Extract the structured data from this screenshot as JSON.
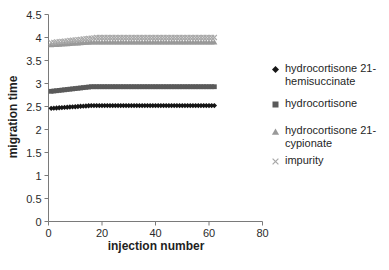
{
  "figure": {
    "background": "#ffffff",
    "axis_color": "#7a7a7a",
    "tick_text_color": "#2b2b2b"
  },
  "chart_data": {
    "type": "scatter",
    "title": "",
    "xlabel": "injection number",
    "ylabel": "migration time",
    "xlim": [
      0,
      80
    ],
    "ylim": [
      0,
      4.5
    ],
    "x_ticks": [
      "0",
      "20",
      "40",
      "60",
      "80"
    ],
    "y_ticks": [
      "0",
      "0.5",
      "1",
      "1.5",
      "2",
      "2.5",
      "3",
      "3.5",
      "4",
      "4.5"
    ],
    "grid": "off",
    "legend_position": "right",
    "x": [
      1,
      2,
      3,
      4,
      5,
      6,
      7,
      8,
      9,
      10,
      11,
      12,
      13,
      14,
      15,
      16,
      17,
      18,
      19,
      20,
      21,
      22,
      23,
      24,
      25,
      26,
      27,
      28,
      29,
      30,
      31,
      32,
      33,
      34,
      35,
      36,
      37,
      38,
      39,
      40,
      41,
      42,
      43,
      44,
      45,
      46,
      47,
      48,
      49,
      50,
      51,
      52,
      53,
      54,
      55,
      56,
      57,
      58,
      59,
      60,
      61,
      62
    ],
    "series": [
      {
        "name": "hydrocortisone 21-hemisuccinate",
        "marker": "diamond",
        "color": "#161616",
        "values": [
          2.46,
          2.464,
          2.468,
          2.472,
          2.476,
          2.48,
          2.484,
          2.488,
          2.492,
          2.496,
          2.5,
          2.504,
          2.508,
          2.512,
          2.516,
          2.52,
          2.52,
          2.52,
          2.52,
          2.52,
          2.52,
          2.52,
          2.52,
          2.52,
          2.52,
          2.52,
          2.52,
          2.52,
          2.52,
          2.52,
          2.52,
          2.52,
          2.52,
          2.52,
          2.52,
          2.52,
          2.52,
          2.52,
          2.52,
          2.52,
          2.52,
          2.52,
          2.52,
          2.52,
          2.52,
          2.52,
          2.52,
          2.52,
          2.52,
          2.52,
          2.52,
          2.52,
          2.52,
          2.52,
          2.52,
          2.52,
          2.52,
          2.52,
          2.52,
          2.52,
          2.52,
          2.52
        ]
      },
      {
        "name": "hydrocortisone",
        "marker": "square",
        "color": "#5a5a5a",
        "values": [
          2.83,
          2.837,
          2.843,
          2.85,
          2.857,
          2.863,
          2.87,
          2.877,
          2.883,
          2.89,
          2.897,
          2.903,
          2.91,
          2.917,
          2.923,
          2.93,
          2.93,
          2.93,
          2.93,
          2.93,
          2.93,
          2.93,
          2.93,
          2.93,
          2.93,
          2.93,
          2.93,
          2.93,
          2.93,
          2.93,
          2.93,
          2.93,
          2.93,
          2.93,
          2.93,
          2.93,
          2.93,
          2.93,
          2.93,
          2.93,
          2.93,
          2.93,
          2.93,
          2.93,
          2.93,
          2.93,
          2.93,
          2.93,
          2.93,
          2.93,
          2.93,
          2.93,
          2.93,
          2.93,
          2.93,
          2.93,
          2.93,
          2.93,
          2.93,
          2.93,
          2.93,
          2.93
        ]
      },
      {
        "name": "hydrocortisone 21-cypionate",
        "marker": "triangle",
        "color": "#999999",
        "values": [
          3.84,
          3.844,
          3.848,
          3.852,
          3.856,
          3.86,
          3.864,
          3.868,
          3.872,
          3.876,
          3.88,
          3.884,
          3.888,
          3.892,
          3.896,
          3.9,
          3.9,
          3.9,
          3.9,
          3.9,
          3.9,
          3.9,
          3.9,
          3.9,
          3.9,
          3.9,
          3.9,
          3.9,
          3.9,
          3.9,
          3.9,
          3.9,
          3.9,
          3.9,
          3.9,
          3.9,
          3.9,
          3.9,
          3.9,
          3.9,
          3.9,
          3.9,
          3.9,
          3.9,
          3.9,
          3.9,
          3.9,
          3.9,
          3.9,
          3.9,
          3.9,
          3.9,
          3.9,
          3.9,
          3.9,
          3.9,
          3.9,
          3.9,
          3.9,
          3.9,
          3.9,
          3.9
        ]
      },
      {
        "name": "impurity",
        "marker": "x",
        "color": "#a8a8a8",
        "values": [
          3.89,
          3.896,
          3.903,
          3.909,
          3.916,
          3.922,
          3.929,
          3.935,
          3.942,
          3.948,
          3.955,
          3.961,
          3.968,
          3.974,
          3.981,
          3.987,
          3.994,
          4,
          4,
          4,
          4,
          4,
          4,
          4,
          4,
          4,
          4,
          4,
          4,
          4,
          4,
          4,
          4,
          4,
          4,
          4,
          4,
          4,
          4,
          4,
          4,
          4,
          4,
          4,
          4,
          4,
          4,
          4,
          4,
          4,
          4,
          4,
          4,
          4,
          4,
          4,
          4,
          4,
          4,
          4,
          4,
          4
        ]
      }
    ]
  }
}
